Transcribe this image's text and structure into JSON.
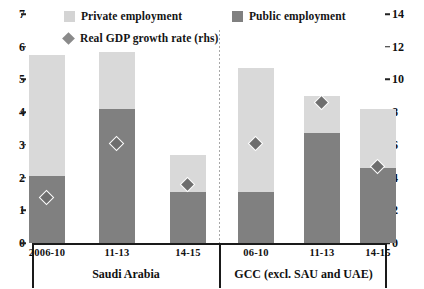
{
  "legend": {
    "private": {
      "label": "Private employment",
      "color": "#d9d9d9",
      "icon": "square-swatch-icon"
    },
    "public": {
      "label": "Public employment",
      "color": "#808080",
      "icon": "square-swatch-icon"
    },
    "gdp": {
      "label": "Real GDP growth rate (rhs)",
      "color": "#6e6e6e",
      "icon": "diamond-marker-icon"
    }
  },
  "axes": {
    "left_ticks": [
      "0",
      "1",
      "2",
      "3",
      "4",
      "5",
      "6",
      "7"
    ],
    "right_ticks": [
      "0",
      "2",
      "4",
      "6",
      "8",
      "10",
      "12",
      "14"
    ]
  },
  "groups": [
    {
      "name": "Saudi Arabia",
      "periods": [
        "2006-10",
        "11-13",
        "14-15"
      ]
    },
    {
      "name": "GCC (excl. SAU and UAE)",
      "periods": [
        "06-10",
        "11-13",
        "14-15"
      ]
    }
  ],
  "chart_data": {
    "type": "bar",
    "title": "",
    "xlabel": "",
    "ylabel": "",
    "grid": false,
    "legend_position": "top",
    "stacked": true,
    "categories": [
      "2006-10",
      "11-13",
      "14-15",
      "06-10",
      "11-13",
      "14-15"
    ],
    "group_labels": [
      "Saudi Arabia",
      "Saudi Arabia",
      "Saudi Arabia",
      "GCC (excl. SAU and UAE)",
      "GCC (excl. SAU and UAE)",
      "GCC (excl. SAU and UAE)"
    ],
    "ylim": [
      0,
      7
    ],
    "y2lim": [
      0,
      14
    ],
    "yticks": [
      0,
      1,
      2,
      3,
      4,
      5,
      6,
      7
    ],
    "y2ticks": [
      0,
      2,
      4,
      6,
      8,
      10,
      12,
      14
    ],
    "series": [
      {
        "name": "Public employment",
        "axis": "left",
        "type": "bar",
        "values": [
          2.05,
          4.1,
          1.55,
          1.55,
          3.35,
          2.3
        ]
      },
      {
        "name": "Private employment",
        "axis": "left",
        "type": "bar",
        "values": [
          3.7,
          1.75,
          1.15,
          3.8,
          1.15,
          1.8
        ]
      },
      {
        "name": "Real GDP growth rate (rhs)",
        "axis": "right",
        "type": "scatter",
        "values": [
          2.7,
          6.0,
          3.5,
          6.0,
          8.5,
          4.6
        ]
      }
    ],
    "totals": [
      5.75,
      5.85,
      2.7,
      5.35,
      4.5,
      4.1
    ]
  }
}
